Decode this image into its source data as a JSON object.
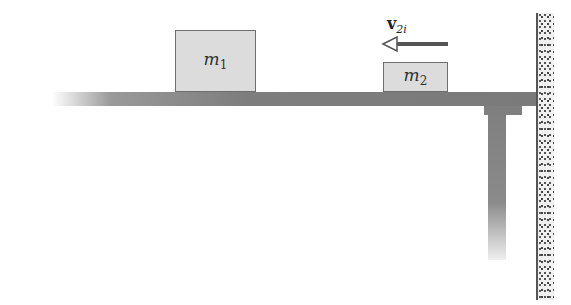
{
  "diagram": {
    "title": "",
    "blocks": [
      {
        "id": "m1",
        "symbol": "m",
        "subscript": "1"
      },
      {
        "id": "m2",
        "symbol": "m",
        "subscript": "2"
      }
    ],
    "velocity": {
      "symbol": "v",
      "subscript": "2i",
      "direction": "left"
    },
    "elements": [
      "table-top",
      "table-leg",
      "wall"
    ],
    "colors": {
      "block_fill": "#dcdcdc",
      "block_border": "#6e6e6e",
      "table": "#7d7d7d",
      "arrow": "#555555"
    }
  }
}
